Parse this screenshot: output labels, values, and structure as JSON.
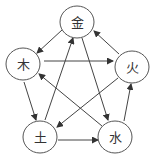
{
  "diagram": {
    "title": "",
    "nodes": [
      {
        "id": "jin",
        "label": "金",
        "cx": 77,
        "cy": 22,
        "r": 17
      },
      {
        "id": "mu",
        "label": "木",
        "cx": 23,
        "cy": 64,
        "r": 17
      },
      {
        "id": "huo",
        "label": "火",
        "cx": 132,
        "cy": 67,
        "r": 17
      },
      {
        "id": "tu",
        "label": "土",
        "cx": 40,
        "cy": 137,
        "r": 17
      },
      {
        "id": "shui",
        "label": "水",
        "cx": 115,
        "cy": 137,
        "r": 17
      }
    ],
    "edges": [
      {
        "from": "jin",
        "to": "mu",
        "x1": 62,
        "y1": 30,
        "x2": 37,
        "y2": 53
      },
      {
        "from": "mu",
        "to": "huo",
        "x1": 44,
        "y1": 61,
        "x2": 113,
        "y2": 61
      },
      {
        "from": "huo",
        "to": "jin",
        "x1": 119,
        "y1": 54,
        "x2": 94,
        "y2": 31
      },
      {
        "from": "mu",
        "to": "tu",
        "x1": 24,
        "y1": 82,
        "x2": 36,
        "y2": 120
      },
      {
        "from": "tu",
        "to": "jin",
        "x1": 45,
        "y1": 120,
        "x2": 73,
        "y2": 38
      },
      {
        "from": "jin",
        "to": "shui",
        "x1": 82,
        "y1": 38,
        "x2": 108,
        "y2": 120
      },
      {
        "from": "huo",
        "to": "tu",
        "x1": 118,
        "y1": 78,
        "x2": 57,
        "y2": 127
      },
      {
        "from": "tu",
        "to": "shui",
        "x1": 58,
        "y1": 140,
        "x2": 98,
        "y2": 140
      },
      {
        "from": "shui",
        "to": "huo",
        "x1": 124,
        "y1": 121,
        "x2": 131,
        "y2": 84
      },
      {
        "from": "shui",
        "to": "mu",
        "x1": 102,
        "y1": 126,
        "x2": 39,
        "y2": 74
      }
    ]
  }
}
